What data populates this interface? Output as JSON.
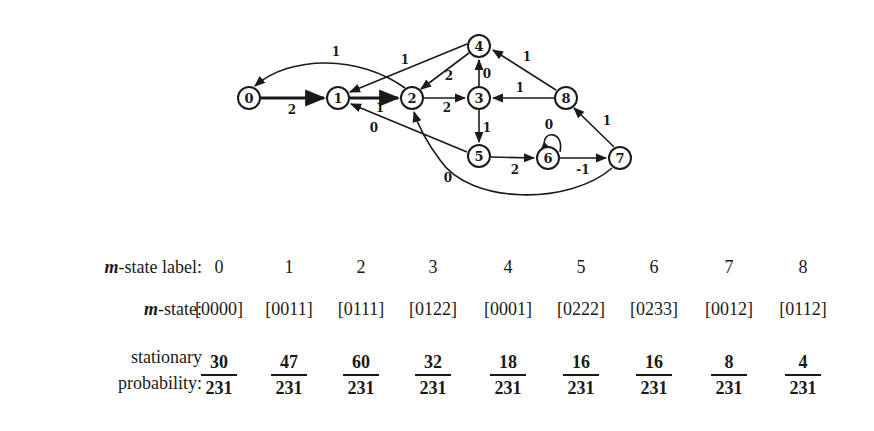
{
  "graph": {
    "nodes": [
      {
        "id": "0",
        "x": 249,
        "y": 98
      },
      {
        "id": "1",
        "x": 338,
        "y": 98
      },
      {
        "id": "2",
        "x": 412,
        "y": 98
      },
      {
        "id": "3",
        "x": 479,
        "y": 98
      },
      {
        "id": "4",
        "x": 479,
        "y": 46
      },
      {
        "id": "5",
        "x": 479,
        "y": 156
      },
      {
        "id": "6",
        "x": 548,
        "y": 158
      },
      {
        "id": "7",
        "x": 620,
        "y": 158
      },
      {
        "id": "8",
        "x": 566,
        "y": 98
      }
    ],
    "edges": [
      {
        "from": "0",
        "to": "1",
        "label": "2"
      },
      {
        "from": "1",
        "to": "2",
        "label": "1"
      },
      {
        "from": "2",
        "to": "0",
        "label": "1"
      },
      {
        "from": "2",
        "to": "3",
        "label": "2"
      },
      {
        "from": "4",
        "to": "1",
        "label": "1"
      },
      {
        "from": "4",
        "to": "2",
        "label": "2"
      },
      {
        "from": "3",
        "to": "4",
        "label": "0"
      },
      {
        "from": "3",
        "to": "5",
        "label": "1"
      },
      {
        "from": "8",
        "to": "3",
        "label": "1"
      },
      {
        "from": "8",
        "to": "4",
        "label": "1"
      },
      {
        "from": "5",
        "to": "1",
        "label": "0"
      },
      {
        "from": "5",
        "to": "6",
        "label": "2"
      },
      {
        "from": "6",
        "to": "6",
        "label": "0"
      },
      {
        "from": "6",
        "to": "7",
        "label": "-1"
      },
      {
        "from": "7",
        "to": "8",
        "label": "1"
      },
      {
        "from": "7",
        "to": "2",
        "label": "0"
      }
    ]
  },
  "table": {
    "row_labels": {
      "label_row_prefix": "m",
      "label_row_suffix": "-state label:",
      "state_row_prefix": "m",
      "state_row_suffix": "-state:",
      "prob_row_line1": "stationary",
      "prob_row_line2": "probability:"
    },
    "columns": [
      {
        "label": "0",
        "state": "[0000]",
        "num": "30",
        "den": "231"
      },
      {
        "label": "1",
        "state": "[0011]",
        "num": "47",
        "den": "231"
      },
      {
        "label": "2",
        "state": "[0111]",
        "num": "60",
        "den": "231"
      },
      {
        "label": "3",
        "state": "[0122]",
        "num": "32",
        "den": "231"
      },
      {
        "label": "4",
        "state": "[0001]",
        "num": "18",
        "den": "231"
      },
      {
        "label": "5",
        "state": "[0222]",
        "num": "16",
        "den": "231"
      },
      {
        "label": "6",
        "state": "[0233]",
        "num": "16",
        "den": "231"
      },
      {
        "label": "7",
        "state": "[0012]",
        "num": "8",
        "den": "231"
      },
      {
        "label": "8",
        "state": "[0112]",
        "num": "4",
        "den": "231"
      }
    ]
  }
}
